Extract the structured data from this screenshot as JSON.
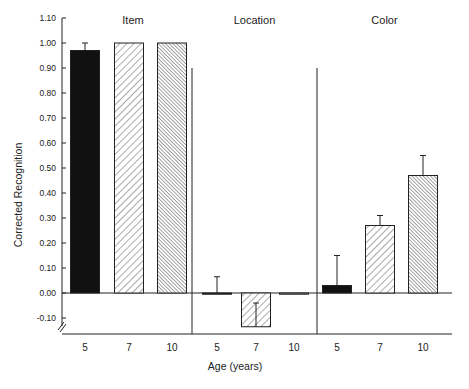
{
  "chart_data": {
    "type": "bar",
    "title": "",
    "xlabel": "Age (years)",
    "ylabel": "Corrected Recognition",
    "ylim": [
      -0.1,
      1.1
    ],
    "yticks": [
      "1.10",
      "1.00",
      "0.90",
      "0.80",
      "0.70",
      "0.60",
      "0.50",
      "0.40",
      "0.30",
      "0.20",
      "0.10",
      "0.00",
      "-0.10"
    ],
    "ytick_values": [
      1.1,
      1.0,
      0.9,
      0.8,
      0.7,
      0.6,
      0.5,
      0.4,
      0.3,
      0.2,
      0.1,
      0.0,
      -0.1
    ],
    "categories": [
      "5",
      "7",
      "10"
    ],
    "grid": false,
    "legend": "none (age groups distinguished by fill: 5 = solid black, 7 = wide hatch, 10 = dense hatch)",
    "axis_break": true,
    "panels": [
      {
        "name": "Item",
        "values": [
          0.97,
          1.0,
          1.0
        ],
        "error_upper": [
          1.0,
          null,
          null
        ]
      },
      {
        "name": "Location",
        "values": [
          0.0,
          -0.135,
          0.0
        ],
        "error_upper": [
          0.065,
          -0.04,
          null
        ]
      },
      {
        "name": "Color",
        "values": [
          0.03,
          0.27,
          0.47
        ],
        "error_upper": [
          0.15,
          0.31,
          0.55
        ]
      }
    ]
  },
  "labels": {
    "ylabel": "Corrected Recognition",
    "xlabel": "Age (years)",
    "panel_item": "Item",
    "panel_location": "Location",
    "panel_color": "Color"
  }
}
